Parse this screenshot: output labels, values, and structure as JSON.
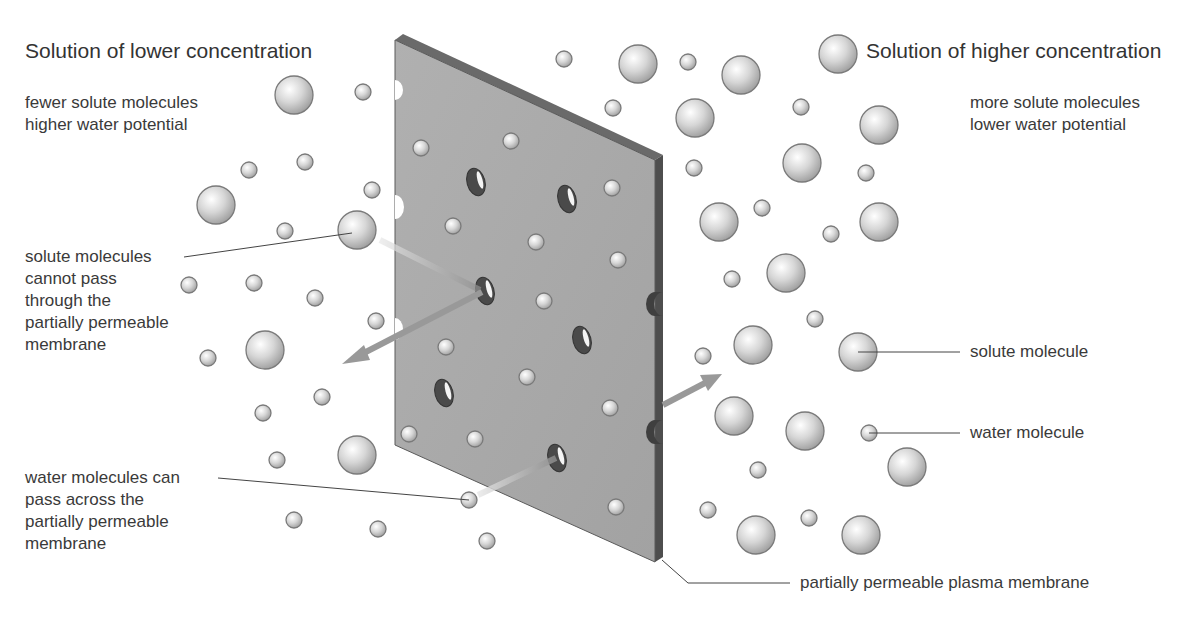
{
  "titles": {
    "left": "Solution of lower concentration",
    "right": "Solution of higher concentration"
  },
  "descriptions": {
    "left": "fewer solute molecules\nhigher water potential",
    "right": "more solute molecules\nlower water potential"
  },
  "annotations": {
    "solute_cannot_pass": "solute molecules\ncannot pass\nthrough the\npartially permeable\nmembrane",
    "water_can_pass": "water molecules can\npass across the\npartially permeable\nmembrane",
    "solute_molecule": "solute molecule",
    "water_molecule": "water molecule",
    "membrane": "partially permeable plasma membrane"
  },
  "legend": [
    {
      "name": "solute molecule",
      "size": "large"
    },
    {
      "name": "water molecule",
      "size": "small"
    }
  ],
  "colors": {
    "membrane_face": "#a9a9a9",
    "membrane_edge": "#555555",
    "molecule_fill": "#d8d8d8",
    "arrow": "#9a9a9a"
  }
}
